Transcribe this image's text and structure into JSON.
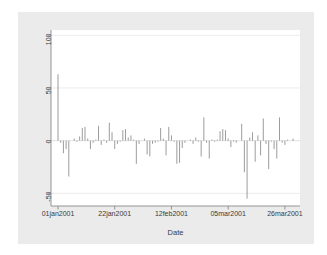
{
  "chart_data": {
    "type": "bar",
    "title": "",
    "subtitle": "",
    "xlabel": "Date",
    "ylabel": "Closing price change",
    "ylim": [
      -62,
      105
    ],
    "xlim": [
      "01jan2001",
      "30mar2001"
    ],
    "grid": true,
    "gridlines_y": [
      100,
      50,
      0,
      -50
    ],
    "legend": "none",
    "y_ticks": [
      {
        "value": 100,
        "label": "100"
      },
      {
        "value": 50,
        "label": "50"
      },
      {
        "value": 0,
        "label": "0"
      },
      {
        "value": -50,
        "label": "-50"
      }
    ],
    "x_ticks": [
      {
        "index": 0,
        "label": "01jan2001"
      },
      {
        "index": 21,
        "label": "22jan2001"
      },
      {
        "index": 42,
        "label": "12feb2001"
      },
      {
        "index": 63,
        "label": "05mar2001"
      },
      {
        "index": 84,
        "label": "26mar2001"
      }
    ],
    "series_color": "#8a8a8a",
    "series": [
      {
        "name": "Closing price change",
        "x": [
          0,
          1,
          2,
          3,
          4,
          5,
          6,
          7,
          8,
          9,
          10,
          11,
          12,
          13,
          14,
          15,
          16,
          17,
          18,
          19,
          20,
          21,
          22,
          23,
          24,
          25,
          26,
          27,
          28,
          29,
          30,
          31,
          32,
          33,
          34,
          35,
          36,
          37,
          38,
          39,
          40,
          41,
          42,
          43,
          44,
          45,
          46,
          47,
          48,
          49,
          50,
          51,
          52,
          53,
          54,
          55,
          56,
          57,
          58,
          59,
          60,
          61,
          62,
          63,
          64,
          65,
          66,
          67,
          68,
          69,
          70,
          71,
          72,
          73,
          74,
          75,
          76,
          77,
          78,
          79,
          80,
          81,
          82,
          83,
          84,
          85,
          86,
          87
        ],
        "values": [
          63,
          -2,
          -12,
          -8,
          -34,
          0,
          2,
          -1,
          4,
          12,
          13,
          2,
          -8,
          -2,
          1,
          14,
          -4,
          1,
          -2,
          17,
          8,
          -8,
          -3,
          -1,
          10,
          11,
          3,
          5,
          1,
          -22,
          -3,
          0,
          2,
          -13,
          -15,
          -3,
          -2,
          -1,
          12,
          2,
          -14,
          13,
          5,
          -1,
          -22,
          -21,
          -7,
          -2,
          0,
          1,
          -3,
          3,
          -1,
          -15,
          22,
          -2,
          -17,
          1,
          -1,
          1,
          9,
          11,
          10,
          2,
          -6,
          -1,
          -2,
          0,
          16,
          -30,
          -55,
          3,
          8,
          -20,
          5,
          -14,
          21,
          -3,
          -27,
          -1,
          -8,
          -17,
          22,
          -2,
          -4,
          1,
          0,
          2
        ]
      }
    ]
  },
  "axes": {
    "y_title": "Closing price change",
    "x_title": "Date"
  }
}
